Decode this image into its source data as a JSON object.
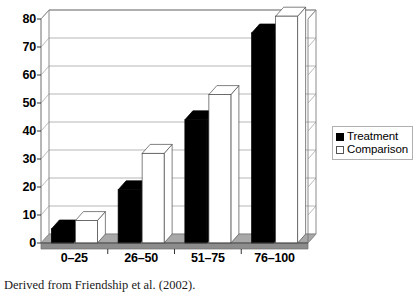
{
  "chart_data": {
    "type": "bar",
    "title": "",
    "subtitle": "",
    "xlabel": "",
    "ylabel": "",
    "categories": [
      "0–25",
      "26–50",
      "51–75",
      "76–100"
    ],
    "series": [
      {
        "name": "Treatment",
        "values": [
          5,
          19,
          44,
          75
        ],
        "color": "#000000"
      },
      {
        "name": "Comparison",
        "values": [
          8,
          32,
          53,
          81
        ],
        "color": "#ffffff"
      }
    ],
    "ylim": [
      0,
      80
    ],
    "yticks": [
      0,
      10,
      20,
      30,
      40,
      50,
      60,
      70,
      80
    ],
    "ytick_labels": [
      "0",
      "10",
      "20",
      "30",
      "40",
      "50",
      "60",
      "70",
      "80"
    ],
    "grid": true,
    "grid_axis": "y",
    "legend_position": "right",
    "style": "3d-column",
    "annotations": []
  },
  "legend": {
    "entries": [
      {
        "label": "Treatment",
        "swatch": "filled-square-icon"
      },
      {
        "label": "Comparison",
        "swatch": "hollow-square-icon"
      }
    ]
  },
  "caption": {
    "text": "Derived from Friendship et al. (2002)."
  },
  "colors": {
    "treatment": "#000000",
    "comparison": "#ffffff",
    "floor": "#8c8c8c",
    "floor_top": "#a8a8a8",
    "axis": "#6e6e6e",
    "grid": "#9a9a9a",
    "text": "#000000"
  }
}
